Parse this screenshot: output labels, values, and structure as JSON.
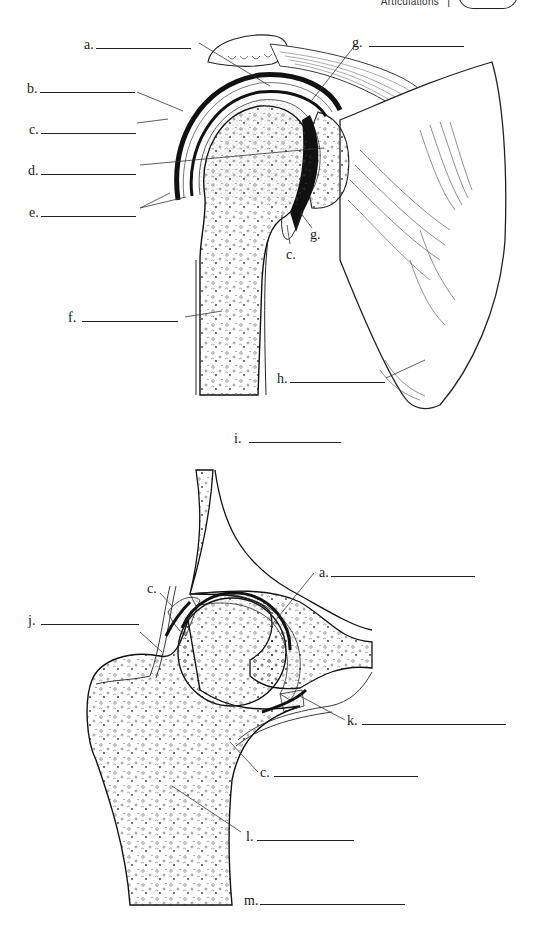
{
  "header": {
    "section_title": "Articulations",
    "separator": "|"
  },
  "shoulder_diagram": {
    "title_label": {
      "letter": "i.",
      "blank_width": 92
    },
    "labels": [
      {
        "id": "a",
        "letter": "a.",
        "blank_width": 95
      },
      {
        "id": "b",
        "letter": "b.",
        "blank_width": 95
      },
      {
        "id": "c",
        "letter": "c.",
        "blank_width": 95
      },
      {
        "id": "d",
        "letter": "d.",
        "blank_width": 95
      },
      {
        "id": "e",
        "letter": "e.",
        "blank_width": 95
      },
      {
        "id": "f",
        "letter": "f.",
        "blank_width": 96
      },
      {
        "id": "g",
        "letter": "g.",
        "blank_width": 95
      },
      {
        "id": "h",
        "letter": "h.",
        "blank_width": 95
      }
    ],
    "inline_labels": [
      {
        "id": "g2",
        "letter": "g."
      },
      {
        "id": "c2",
        "letter": "c."
      }
    ]
  },
  "hip_diagram": {
    "labels": [
      {
        "id": "a",
        "letter": "a.",
        "blank_width": 144
      },
      {
        "id": "c",
        "letter": "c.",
        "blank_width": 102
      },
      {
        "id": "j",
        "letter": "j.",
        "blank_width": 98
      },
      {
        "id": "k",
        "letter": "k.",
        "blank_width": 144
      },
      {
        "id": "c-lower",
        "letter": "c.",
        "blank_width": 144
      },
      {
        "id": "l",
        "letter": "l.",
        "blank_width": 97
      },
      {
        "id": "m",
        "letter": "m.",
        "blank_width": 145
      }
    ]
  }
}
